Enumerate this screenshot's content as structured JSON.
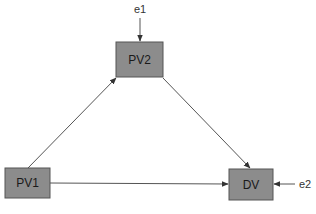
{
  "diagram": {
    "type": "path-diagram",
    "nodes": [
      {
        "id": "PV1",
        "label": "PV1",
        "x": 5,
        "y": 168,
        "w": 45,
        "h": 30
      },
      {
        "id": "PV2",
        "label": "PV2",
        "x": 116,
        "y": 42,
        "w": 47,
        "h": 35
      },
      {
        "id": "DV",
        "label": "DV",
        "x": 229,
        "y": 169,
        "w": 44,
        "h": 31
      }
    ],
    "error_terms": [
      {
        "id": "e1",
        "label": "e1",
        "target": "PV2"
      },
      {
        "id": "e2",
        "label": "e2",
        "target": "DV"
      }
    ],
    "edges": [
      {
        "from": "PV1",
        "to": "PV2"
      },
      {
        "from": "PV2",
        "to": "DV"
      },
      {
        "from": "PV1",
        "to": "DV"
      },
      {
        "from": "e1",
        "to": "PV2"
      },
      {
        "from": "e2",
        "to": "DV"
      }
    ],
    "colors": {
      "node_fill": "#8c8c8c",
      "node_stroke": "#555555",
      "edge": "#555555",
      "text": "#1a1a1a"
    }
  }
}
